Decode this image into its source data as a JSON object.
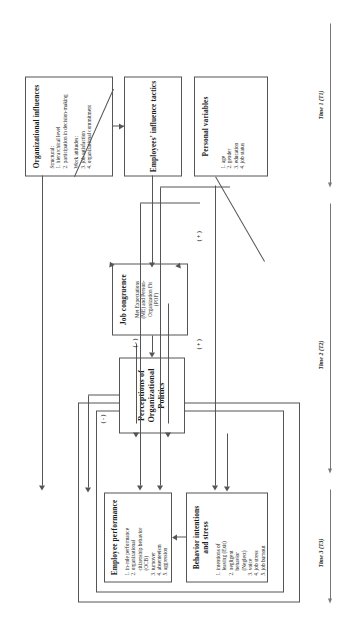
{
  "figure": {
    "type": "conceptual-model-diagram",
    "orientation": "rotated-90-ccw",
    "boxes": {
      "employee_performance": {
        "title": "Employee performance",
        "items": [
          "1. in-role performance",
          "2. organizational",
          "citizenship behavior",
          "(OCB)",
          "3. turnover",
          "4. absenteeism",
          "5. aggression"
        ]
      },
      "behavior_intentions": {
        "title": "Behavior intentions and stress",
        "items": [
          "1. intentions of",
          "leaving (Exit)",
          "2. negligent",
          "behavior",
          "(Neglect)",
          "3. voice",
          "4. job stress",
          "5. job burnout"
        ]
      },
      "perceptions": {
        "title": "Perceptions of Organizational Politics",
        "items": []
      },
      "job_congruence": {
        "title": "Job congruence",
        "items": [
          "Met Expectations",
          "(ME) and Person-",
          "Organization Fit",
          "(POF)"
        ]
      },
      "organizational_influences": {
        "title": "Organizational influences",
        "items": [
          "Structural:",
          "1. hierarchical level",
          "2. participation in decision-making",
          "",
          "Work attitudes:",
          "3. job satisfaction",
          "4. organizational commitment"
        ]
      },
      "influence_tactics": {
        "title": "Employees' influence tactics",
        "items": []
      },
      "personal_variables": {
        "title": "Personal variables",
        "items": [
          "1. age",
          "2. gender",
          "3. education",
          "4. job status"
        ]
      }
    },
    "signs": {
      "neg_top": "( - )",
      "pos_mid": "( + )",
      "neg_congruence": "( - )",
      "pos_bottom": "( + )"
    },
    "time_axis": [
      {
        "id": "t1",
        "label": "Time 1 (T1)"
      },
      {
        "id": "t2",
        "label": "Time 2 (T2)"
      },
      {
        "id": "t3",
        "label": "Time 3 (T3)"
      }
    ],
    "colors": {
      "line": "#555555",
      "text": "#1a1a1a",
      "background": "#ffffff"
    }
  }
}
